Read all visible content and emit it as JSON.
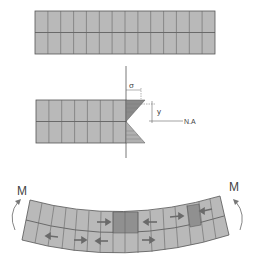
{
  "diagram": {
    "colors": {
      "beam_fill": "#b9b9b9",
      "beam_line": "#555555",
      "stress_fill": "#8a8a8a",
      "highlight_fill": "#8f8f8f",
      "arrow": "#6a6a6a",
      "text": "#444444"
    },
    "top_beam": {
      "columns": 14,
      "rows": 2
    },
    "stress_section": {
      "columns": 7,
      "rows": 2,
      "labels": {
        "sigma": "σ",
        "y": "y",
        "neutral_axis": "N.A"
      }
    },
    "bent_beam": {
      "moment_left": "M",
      "moment_right": "M"
    }
  }
}
